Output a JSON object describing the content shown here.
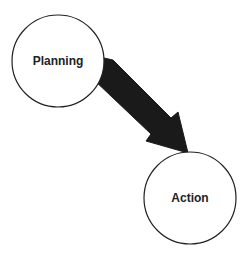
{
  "diagram": {
    "nodes": [
      {
        "id": "planning",
        "label": "Planning",
        "cx": 58,
        "cy": 61,
        "r": 46
      },
      {
        "id": "action",
        "label": "Action",
        "cx": 190,
        "cy": 198,
        "r": 46
      }
    ],
    "edges": [
      {
        "from": "planning",
        "to": "action",
        "style": "thick-filled-arrow"
      }
    ],
    "colors": {
      "stroke": "#222222",
      "arrow": "#1a1a1a",
      "background": "#ffffff"
    }
  }
}
